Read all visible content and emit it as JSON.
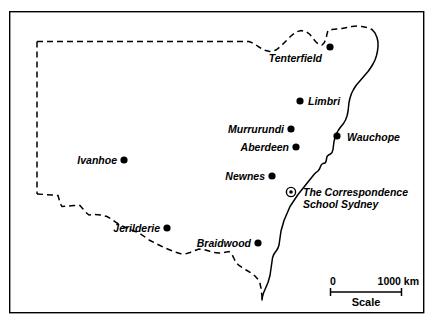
{
  "figure": {
    "width": 433,
    "height": 329,
    "background_color": "#ffffff",
    "ink_color": "#000000"
  },
  "frame": {
    "name": "map-border",
    "x": 9,
    "y": 11,
    "width": 415,
    "height": 302,
    "stroke_width": 1.4
  },
  "boundaries": {
    "state_border": {
      "style": "dashed",
      "description": "Dashed political boundary of New South Wales (north, west and south edges)"
    },
    "coastline": {
      "style": "solid",
      "description": "Solid east coastline of New South Wales"
    }
  },
  "places": [
    {
      "id": "tenterfield",
      "label": "Tenterfield",
      "marker": "filled-dot",
      "marker_x": 330,
      "marker_y": 47,
      "label_x": 322,
      "label_y": 62,
      "label_anchor": "end"
    },
    {
      "id": "limbri",
      "label": "Limbri",
      "marker": "filled-dot",
      "marker_x": 300,
      "marker_y": 101,
      "label_x": 308,
      "label_y": 105,
      "label_anchor": "start"
    },
    {
      "id": "murrurundi",
      "label": "Murrurundi",
      "marker": "filled-dot",
      "marker_x": 291,
      "marker_y": 129,
      "label_x": 284,
      "label_y": 133,
      "label_anchor": "end"
    },
    {
      "id": "wauchope",
      "label": "Wauchope",
      "marker": "filled-dot",
      "marker_x": 337,
      "marker_y": 136,
      "label_x": 347,
      "label_y": 141,
      "label_anchor": "start"
    },
    {
      "id": "aberdeen",
      "label": "Aberdeen",
      "marker": "filled-dot",
      "marker_x": 296,
      "marker_y": 147,
      "label_x": 289,
      "label_y": 151,
      "label_anchor": "end"
    },
    {
      "id": "ivanhoe",
      "label": "Ivanhoe",
      "marker": "filled-dot",
      "marker_x": 124,
      "marker_y": 160,
      "label_x": 117,
      "label_y": 164,
      "label_anchor": "end"
    },
    {
      "id": "newnes",
      "label": "Newnes",
      "marker": "filled-dot",
      "marker_x": 272,
      "marker_y": 176,
      "label_x": 265,
      "label_y": 180,
      "label_anchor": "end"
    },
    {
      "id": "jerilderie",
      "label": "Jerilderie",
      "marker": "filled-dot",
      "marker_x": 167,
      "marker_y": 228,
      "label_x": 160,
      "label_y": 232,
      "label_anchor": "end"
    },
    {
      "id": "braidwood",
      "label": "Braidwood",
      "marker": "filled-dot",
      "marker_x": 258,
      "marker_y": 243,
      "label_x": 251,
      "label_y": 247,
      "label_anchor": "end"
    }
  ],
  "special_marker": {
    "id": "correspondence-school-sydney",
    "marker": "target-dot",
    "marker_x": 291,
    "marker_y": 192,
    "label_line1": "The Correspondence",
    "label_line2": "School Sydney",
    "label_x": 303,
    "label_line1_y": 196,
    "label_line2_y": 208
  },
  "scale_bar": {
    "min_label": "0",
    "max_label": "1000 km",
    "caption": "Scale",
    "bar_x1": 330,
    "bar_x2": 402,
    "bar_y": 292,
    "min_label_x": 330,
    "max_label_x": 419,
    "labels_y": 285,
    "caption_x": 366,
    "caption_y": 306
  }
}
